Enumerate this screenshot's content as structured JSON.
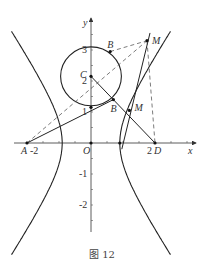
{
  "figure": {
    "caption": "图 12",
    "axes": {
      "x_label": "x",
      "y_label": "y",
      "origin_label": "O"
    },
    "y_ticks": [
      {
        "value": 3,
        "label": "3"
      },
      {
        "value": 2,
        "label": "2"
      },
      {
        "value": 1,
        "label": "1"
      },
      {
        "value": -1,
        "label": "-1"
      },
      {
        "value": -2,
        "label": "-2"
      }
    ],
    "x_ticks": [
      {
        "value": -2,
        "label": "-2"
      },
      {
        "value": 2,
        "label": "2"
      }
    ],
    "points": {
      "A": {
        "label": "A",
        "x": -2,
        "y": 0
      },
      "D": {
        "label": "D",
        "x": 2,
        "y": 0
      },
      "C": {
        "label": "C",
        "x": 0,
        "y": 2.15
      },
      "B_upper": {
        "label": "B",
        "x": 0.6,
        "y": 2.95
      },
      "B_lower": {
        "label": "B",
        "x": 0.7,
        "y": 1.4
      },
      "M_upper": {
        "label": "M",
        "x": 1.75,
        "y": 3.3
      },
      "M_lower": {
        "label": "M",
        "x": 1.2,
        "y": 1.05
      },
      "P_circle_bottom": {
        "x": 0,
        "y": 1.15
      },
      "V_right": {
        "x": 0.9,
        "y": 0
      }
    },
    "circle": {
      "center": "C",
      "radius": 0.95
    },
    "hyperbola": {
      "a": 0.9,
      "b": 1.4
    }
  }
}
